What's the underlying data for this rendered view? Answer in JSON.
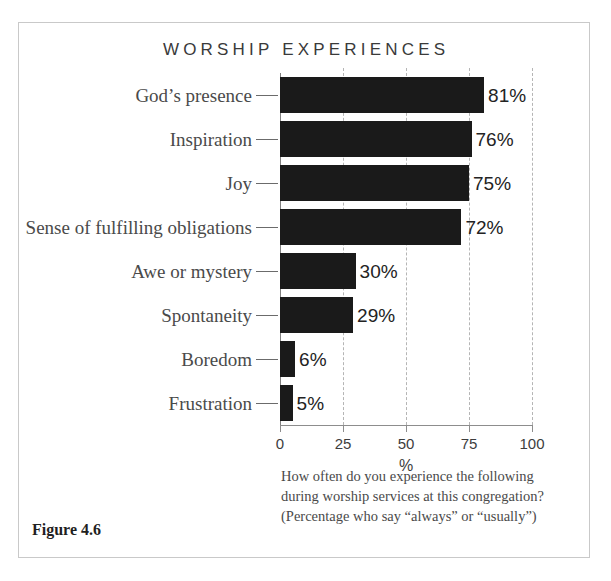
{
  "figure": {
    "number_label": "Figure 4.6",
    "caption": "How often do you experience the following during worship services at this congregation? (Percentage who say “always” or “usually”)"
  },
  "chart_data": {
    "type": "bar",
    "orientation": "horizontal",
    "title": "WORSHIP EXPERIENCES",
    "xlabel": "%",
    "ylabel": "",
    "xlim": [
      0,
      100
    ],
    "xticks": [
      0,
      25,
      50,
      75,
      100
    ],
    "xtick_labels": [
      "0",
      "25",
      "50",
      "75",
      "100"
    ],
    "grid": "vertical-dashed",
    "legend": "none",
    "categories": [
      "God’s presence",
      "Inspiration",
      "Joy",
      "Sense of fulfilling obligations",
      "Awe or mystery",
      "Spontaneity",
      "Boredom",
      "Frustration"
    ],
    "values": [
      81,
      76,
      75,
      72,
      30,
      29,
      6,
      5
    ],
    "value_labels": [
      "81%",
      "76%",
      "75%",
      "72%",
      "30%",
      "29%",
      "6%",
      "5%"
    ],
    "bar_color": "#1a1a1a"
  },
  "colors": {
    "bar": "#1a1a1a",
    "frame": "#c9c9c9",
    "axis": "#8d8d8d",
    "grid": "#b5b5b5",
    "label_text": "#4a4a4a",
    "value_text": "#232323",
    "title_text": "#3a3a3a"
  }
}
